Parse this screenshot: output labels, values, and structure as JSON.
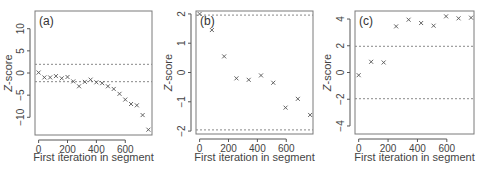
{
  "figure": {
    "panels": [
      {
        "label": "(a)",
        "ylabel": "Z-score",
        "xlabel": "First iteration in segment"
      },
      {
        "label": "(b)",
        "ylabel": "Z-score",
        "xlabel": "First iteration in segment"
      },
      {
        "label": "(c)",
        "ylabel": "Z-score",
        "xlabel": "First iteration in segment"
      }
    ]
  },
  "chart_data": [
    {
      "type": "scatter",
      "title": "(a)",
      "xlabel": "First iteration in segment",
      "ylabel": "Z-score",
      "xticks": [
        0,
        200,
        400,
        600
      ],
      "yticks": [
        -10,
        -5,
        0,
        5,
        10
      ],
      "xlim": [
        -25,
        785
      ],
      "ylim": [
        -14,
        14
      ],
      "reference_lines": [
        1.96,
        -1.96
      ],
      "marker": "x",
      "x": [
        0,
        40,
        80,
        120,
        160,
        200,
        240,
        280,
        320,
        360,
        400,
        440,
        480,
        520,
        560,
        600,
        640,
        680,
        720,
        760
      ],
      "y": [
        0.1,
        -1.0,
        -1.0,
        -0.7,
        -1.2,
        -0.9,
        -1.9,
        -3.0,
        -2.0,
        -1.5,
        -2.1,
        -2.3,
        -3.0,
        -3.6,
        -4.7,
        -6.0,
        -7.0,
        -7.3,
        -9.5,
        -12.8
      ]
    },
    {
      "type": "scatter",
      "title": "(b)",
      "xlabel": "First iteration in segment",
      "ylabel": "Z-score",
      "xticks": [
        0,
        200,
        400,
        600
      ],
      "yticks": [
        -2,
        -1,
        0,
        1,
        2
      ],
      "xlim": [
        -25,
        785
      ],
      "ylim": [
        -2.1,
        2.1
      ],
      "reference_lines": [
        1.96,
        -1.96
      ],
      "marker": "x",
      "x": [
        0,
        85,
        170,
        255,
        340,
        425,
        510,
        595,
        680,
        765
      ],
      "y": [
        2.0,
        1.45,
        0.55,
        -0.2,
        -0.25,
        -0.1,
        -0.35,
        -1.2,
        -0.9,
        -1.45
      ]
    },
    {
      "type": "scatter",
      "title": "(c)",
      "xlabel": "First iteration in segment",
      "ylabel": "Z-score",
      "xticks": [
        0,
        200,
        400,
        600
      ],
      "yticks": [
        -4,
        -2,
        0,
        2,
        4
      ],
      "xlim": [
        -25,
        785
      ],
      "ylim": [
        -4.6,
        4.6
      ],
      "reference_lines": [
        1.96,
        -1.96
      ],
      "marker": "x",
      "x": [
        0,
        85,
        170,
        255,
        340,
        425,
        510,
        595,
        680,
        765
      ],
      "y": [
        -0.2,
        0.8,
        0.75,
        3.45,
        3.95,
        3.7,
        3.5,
        4.2,
        4.05,
        4.1
      ]
    }
  ]
}
